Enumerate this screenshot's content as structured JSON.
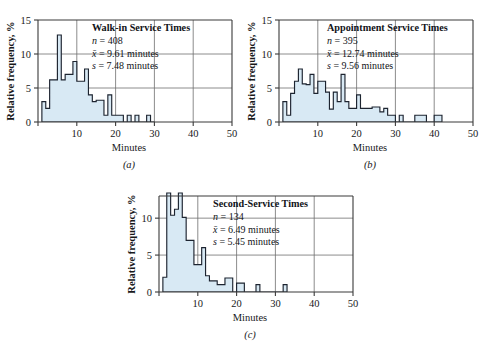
{
  "figure": {
    "background": "#ffffff",
    "bar_fill": "#d8e9f4",
    "bar_stroke": "#1d2430",
    "axis_color": "#3a3a3a",
    "grid_color": "#6e6e6e"
  },
  "panels": [
    {
      "key": "a",
      "letter": "(a)",
      "title": "Walk-in Service Times",
      "stats": [
        {
          "symbol": "n",
          "eq": "=",
          "value": "408",
          "unit": ""
        },
        {
          "symbol": "x̄",
          "eq": "=",
          "value": "9.61",
          "unit": "minutes"
        },
        {
          "symbol": "s",
          "eq": "=",
          "value": "7.48",
          "unit": "minutes"
        }
      ],
      "stat_lines": [
        "n = 408",
        "x̄ = 9.61 minutes",
        "s = 7.48 minutes"
      ],
      "xlabel": "Minutes",
      "ylabel": "Relative frequency, %",
      "xticks": [
        0,
        10,
        20,
        30,
        40,
        50
      ],
      "xtick_labels": [
        "",
        "10",
        "20",
        "30",
        "40",
        "50"
      ],
      "yticks": [
        0,
        5,
        10,
        15
      ],
      "ytick_labels": [
        "0",
        "5",
        "10",
        "15"
      ],
      "xlim": [
        0,
        50
      ],
      "ylim": [
        0,
        15
      ],
      "gridlines_x": [
        10,
        20,
        30,
        40
      ],
      "gridlines_y": [
        5,
        10
      ]
    },
    {
      "key": "b",
      "letter": "(b)",
      "title": "Appointment Service Times",
      "stats": [
        {
          "symbol": "n",
          "eq": "=",
          "value": "395",
          "unit": ""
        },
        {
          "symbol": "x̄",
          "eq": "=",
          "value": "12.74",
          "unit": "minutes"
        },
        {
          "symbol": "s",
          "eq": "=",
          "value": "9.56",
          "unit": "minutes"
        }
      ],
      "stat_lines": [
        "n = 395",
        "x̄ = 12.74 minutes",
        "s = 9.56 minutes"
      ],
      "xlabel": "Minutes",
      "ylabel": "Relative frequency, %",
      "xticks": [
        0,
        10,
        20,
        30,
        40,
        50
      ],
      "xtick_labels": [
        "",
        "10",
        "20",
        "30",
        "40",
        "50"
      ],
      "yticks": [
        0,
        5,
        10,
        15
      ],
      "ytick_labels": [
        "0",
        "5",
        "10",
        "15"
      ],
      "xlim": [
        0,
        50
      ],
      "ylim": [
        0,
        15
      ],
      "gridlines_x": [
        10,
        20,
        30,
        40
      ],
      "gridlines_y": [
        5,
        10
      ]
    },
    {
      "key": "c",
      "letter": "(c)",
      "title": "Second-Service Times",
      "stats": [
        {
          "symbol": "n",
          "eq": "=",
          "value": "134",
          "unit": ""
        },
        {
          "symbol": "x̄",
          "eq": "=",
          "value": "6.49",
          "unit": "minutes"
        },
        {
          "symbol": "s",
          "eq": "=",
          "value": "5.45",
          "unit": "minutes"
        }
      ],
      "stat_lines": [
        "n = 134",
        "x̄ = 6.49 minutes",
        "s = 5.45 minutes"
      ],
      "xlabel": "Minutes",
      "ylabel": "Relative frequency, %",
      "xticks": [
        0,
        10,
        20,
        30,
        40,
        50
      ],
      "xtick_labels": [
        "",
        "10",
        "20",
        "30",
        "40",
        "50"
      ],
      "yticks": [
        0,
        5,
        10
      ],
      "ytick_labels": [
        "0",
        "5",
        "10"
      ],
      "xlim": [
        0,
        50
      ],
      "ylim": [
        0,
        13
      ],
      "gridlines_x": [
        10,
        20,
        30,
        40
      ],
      "gridlines_y": [
        5,
        10
      ]
    }
  ],
  "chart_data": [
    {
      "type": "bar",
      "panel": "a",
      "title": "Walk-in Service Times",
      "xlabel": "Minutes",
      "ylabel": "Relative frequency, %",
      "xlim": [
        0,
        50
      ],
      "ylim": [
        0,
        15
      ],
      "grid": true,
      "bin_width": 1,
      "n": 408,
      "mean": 9.61,
      "sd": 7.48,
      "bin_starts": [
        1,
        2,
        3,
        4,
        5,
        6,
        7,
        8,
        9,
        10,
        11,
        12,
        13,
        14,
        15,
        16,
        17,
        18,
        19,
        20,
        21,
        22,
        23,
        24,
        25,
        26,
        27,
        28,
        29
      ],
      "values": [
        3.0,
        2.0,
        6.2,
        6.2,
        12.8,
        6.2,
        7.0,
        7.0,
        8.9,
        6.0,
        6.0,
        7.8,
        4.0,
        3.0,
        3.2,
        3.2,
        1.0,
        4.0,
        1.0,
        1.0,
        1.0,
        0.0,
        1.0,
        0.0,
        1.0,
        0.0,
        0.0,
        1.0,
        0.0
      ]
    },
    {
      "type": "bar",
      "panel": "b",
      "title": "Appointment Service Times",
      "xlabel": "Minutes",
      "ylabel": "Relative frequency, %",
      "xlim": [
        0,
        50
      ],
      "ylim": [
        0,
        15
      ],
      "grid": true,
      "bin_width": 1,
      "n": 395,
      "mean": 12.74,
      "sd": 9.56,
      "bin_starts": [
        1,
        2,
        3,
        4,
        5,
        6,
        7,
        8,
        9,
        10,
        11,
        12,
        13,
        14,
        15,
        16,
        17,
        18,
        19,
        20,
        21,
        22,
        23,
        24,
        25,
        26,
        27,
        28,
        29,
        30,
        31,
        32,
        33,
        34,
        35,
        36,
        37,
        38,
        39,
        40,
        41
      ],
      "values": [
        3.0,
        1.0,
        4.2,
        6.0,
        7.8,
        5.6,
        5.5,
        7.0,
        4.2,
        6.0,
        6.0,
        4.4,
        1.9,
        4.4,
        3.0,
        7.0,
        3.0,
        2.0,
        2.0,
        4.0,
        2.0,
        2.0,
        2.0,
        2.2,
        2.2,
        1.5,
        2.0,
        1.0,
        1.0,
        0.0,
        1.0,
        0.0,
        0.0,
        0.0,
        1.0,
        1.0,
        1.0,
        0.0,
        0.0,
        1.0,
        1.0
      ]
    },
    {
      "type": "bar",
      "panel": "c",
      "title": "Second-Service Times",
      "xlabel": "Minutes",
      "ylabel": "Relative frequency, %",
      "xlim": [
        0,
        50
      ],
      "ylim": [
        0,
        13
      ],
      "grid": true,
      "bin_width": 1,
      "n": 134,
      "mean": 6.49,
      "sd": 5.45,
      "bin_starts": [
        1,
        2,
        3,
        4,
        5,
        6,
        7,
        8,
        9,
        10,
        11,
        12,
        13,
        14,
        15,
        16,
        17,
        18,
        19,
        20,
        21,
        22,
        23,
        24,
        25,
        26,
        27,
        28,
        29,
        30,
        31,
        32
      ],
      "values": [
        2.0,
        13.4,
        10.4,
        11.2,
        13.4,
        10.1,
        7.0,
        7.0,
        3.7,
        3.7,
        6.0,
        2.2,
        1.5,
        1.5,
        1.0,
        1.0,
        1.9,
        1.9,
        0.0,
        1.2,
        1.2,
        0.0,
        0.0,
        0.0,
        1.0,
        0.0,
        0.0,
        0.0,
        0.0,
        0.0,
        0.0,
        1.0
      ]
    }
  ]
}
